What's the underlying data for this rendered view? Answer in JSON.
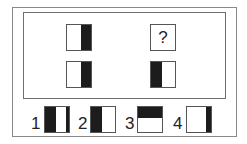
{
  "puzzle": {
    "question_mark": "?",
    "grid": [
      {
        "id": "top-left",
        "fill": "right-half"
      },
      {
        "id": "top-right",
        "fill": "unknown"
      },
      {
        "id": "bottom-left",
        "fill": "right-half"
      },
      {
        "id": "bottom-right",
        "fill": "left-half"
      }
    ]
  },
  "options": [
    {
      "label": "1",
      "fill": "left-half-and-right-strip"
    },
    {
      "label": "2",
      "fill": "left-half"
    },
    {
      "label": "3",
      "fill": "top-half"
    },
    {
      "label": "4",
      "fill": "right-strip"
    }
  ],
  "colors": {
    "fill": "#1c1c1c",
    "border": "#555555",
    "background": "#ffffff"
  }
}
